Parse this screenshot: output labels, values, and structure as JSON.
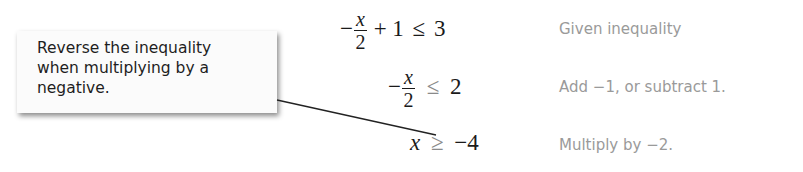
{
  "callout": {
    "lines": [
      "Reverse the inequality",
      "when multiplying by a",
      "negative."
    ]
  },
  "steps": [
    {
      "minus": "−",
      "num": "x",
      "den": "2",
      "rest": "+ 1",
      "relation": "≤",
      "rhs": "3",
      "note": "Given inequality"
    },
    {
      "minus": "−",
      "num": "x",
      "den": "2",
      "relation": "≤",
      "rhs": "2",
      "note": "Add −1, or subtract 1."
    },
    {
      "lhs": "x",
      "relation": "≥",
      "rhs": "−4",
      "note": "Multiply by −2."
    }
  ],
  "colors": {
    "text": "#1a1a1a",
    "highlight_relation": "#8a8a8a",
    "note_text": "#9a9a9a"
  }
}
